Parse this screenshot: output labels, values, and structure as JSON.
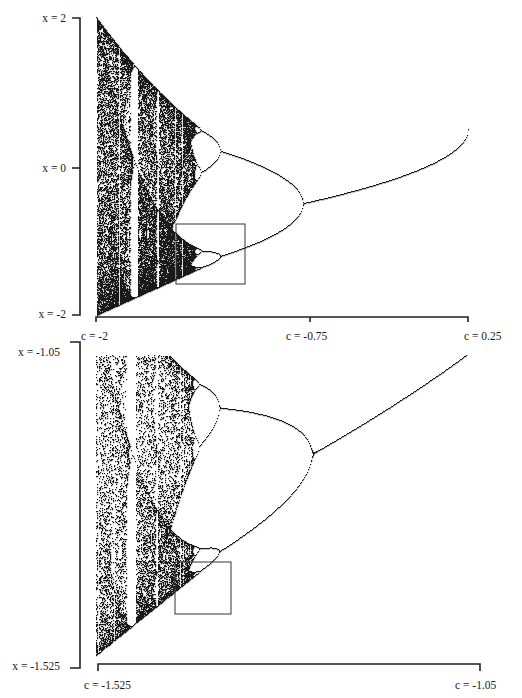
{
  "chart_data": [
    {
      "type": "scatter",
      "title": "Bifurcation diagram of x -> x^2 + c (full)",
      "map": "x_{n+1} = x_n^2 + c",
      "xlabel": "c",
      "ylabel": "x",
      "xlim": [
        -2,
        0.25
      ],
      "ylim": [
        -2,
        2
      ],
      "x_ticks": [
        {
          "value": -2,
          "label": "c = -2"
        },
        {
          "value": -0.75,
          "label": "c = -0.75"
        },
        {
          "value": 0.25,
          "label": "c = 0.25"
        }
      ],
      "y_ticks": [
        {
          "value": 2,
          "label": "x = 2"
        },
        {
          "value": 0,
          "label": "x = 0"
        },
        {
          "value": -2,
          "label": "x = -2"
        }
      ],
      "annotations": [
        {
          "type": "rectangle",
          "description": "zoom region shown in lower plot",
          "c_range": [
            -1.525,
            -1.05
          ],
          "x_range": [
            -1.525,
            -1.05
          ]
        }
      ],
      "notable_points": [
        {
          "c": -0.75,
          "event": "period-doubling bifurcation (1 -> 2)"
        },
        {
          "c": -1.25,
          "event": "period-doubling (2 -> 4)"
        },
        {
          "c": 0.25,
          "event": "end of fixed-point branch, x = 0.5"
        }
      ],
      "grid": false,
      "legend": null
    },
    {
      "type": "scatter",
      "title": "Bifurcation diagram of x -> x^2 + c (magnified)",
      "map": "x_{n+1} = x_n^2 + c",
      "xlabel": "c",
      "ylabel": "x",
      "xlim": [
        -1.525,
        -1.05
      ],
      "ylim": [
        -1.525,
        -1.05
      ],
      "x_ticks": [
        {
          "value": -1.525,
          "label": "c = -1.525"
        },
        {
          "value": -1.05,
          "label": "c = -1.05"
        }
      ],
      "y_ticks": [
        {
          "value": -1.05,
          "label": "x = -1.05"
        },
        {
          "value": -1.525,
          "label": "x = -1.525"
        }
      ],
      "annotations": [
        {
          "type": "rectangle",
          "description": "self-similar zoom region"
        }
      ],
      "grid": false,
      "legend": null
    }
  ],
  "top": {
    "y_labels": {
      "top": "x = 2",
      "mid": "x = 0",
      "bottom": "x = -2"
    },
    "x_labels": {
      "left": "c = -2",
      "mid": "c = -0.75",
      "right": "c = 0.25"
    }
  },
  "bottom": {
    "y_labels": {
      "top": "x = -1.05",
      "bottom": "x = -1.525"
    },
    "x_labels": {
      "left": "c = -1.525",
      "right": "c = -1.05"
    }
  },
  "render": {
    "ink": "#1a1a1a",
    "panels": [
      {
        "cmin": -2,
        "cmax": 0.25,
        "xmin": -2,
        "xmax": 2,
        "px": {
          "left": 96,
          "right": 468,
          "top": 17,
          "bottom": 315
        },
        "box": {
          "x": 176,
          "y": 224,
          "w": 69,
          "h": 60
        }
      },
      {
        "cmin": -1.525,
        "cmax": -1.05,
        "xmin": -1.525,
        "xmax": -1.05,
        "px": {
          "left": 96,
          "right": 468,
          "top": 355,
          "bottom": 655
        },
        "box": {
          "x": 175,
          "y": 562,
          "w": 56,
          "h": 52
        }
      }
    ]
  }
}
